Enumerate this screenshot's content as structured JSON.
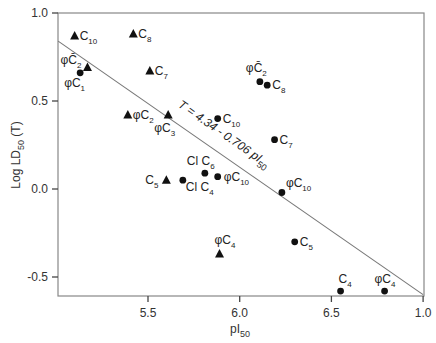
{
  "chart_data": {
    "type": "scatter",
    "title": "",
    "xlabel": "pI50",
    "xlabel_main": "pI",
    "xlabel_sub": "50",
    "ylabel": "Log LD50 (T)",
    "ylabel_main": "Log LD",
    "ylabel_sub": "50",
    "ylabel_suffix": "(T)",
    "xlim": [
      5.01,
      7.0
    ],
    "ylim": [
      -0.6,
      1.0
    ],
    "grid": false,
    "x_ticks": [
      {
        "value": 5.5,
        "label": "5.5"
      },
      {
        "value": 6.0,
        "label": "6.0"
      },
      {
        "value": 6.5,
        "label": "6.5"
      },
      {
        "value": 7.0,
        "label": "1.0"
      }
    ],
    "y_ticks": [
      {
        "value": 1.0,
        "label": "1.0"
      },
      {
        "value": 0.5,
        "label": "0.5"
      },
      {
        "value": 0.0,
        "label": "0.0"
      },
      {
        "value": -0.5,
        "label": "-0.5"
      }
    ],
    "regression": {
      "equation": "T = 4.34 - 0.706 pI50",
      "label_main": "T = 4.34 - 0.706 pI",
      "label_sub": "50",
      "x": [
        5.01,
        7.0
      ],
      "y": [
        0.84,
        -0.6
      ]
    },
    "series": [
      {
        "name": "triangle",
        "marker": "triangle",
        "points": [
          {
            "label": "C",
            "sub": "10",
            "x": 5.1,
            "y": 0.87,
            "lx": 5,
            "ly": 4,
            "anchor": "start"
          },
          {
            "label": "C",
            "sub": "8",
            "x": 5.42,
            "y": 0.88,
            "lx": 5,
            "ly": 4,
            "anchor": "start"
          },
          {
            "label": "φC̄",
            "sub": "2",
            "x": 5.17,
            "y": 0.69,
            "lx": -6,
            "ly": -4,
            "anchor": "end"
          },
          {
            "label": "C",
            "sub": "7",
            "x": 5.51,
            "y": 0.67,
            "lx": 5,
            "ly": 4,
            "anchor": "start"
          },
          {
            "label": "φC",
            "sub": "2",
            "x": 5.39,
            "y": 0.42,
            "lx": 5,
            "ly": 4,
            "anchor": "start"
          },
          {
            "label": "φC",
            "sub": "3",
            "x": 5.61,
            "y": 0.42,
            "lx": -14,
            "ly": 17,
            "anchor": "start"
          },
          {
            "label": "C",
            "sub": "5",
            "x": 5.6,
            "y": 0.05,
            "lx": -8,
            "ly": 4,
            "anchor": "end"
          },
          {
            "label": "φC",
            "sub": "4",
            "x": 5.89,
            "y": -0.37,
            "lx": -5,
            "ly": -10,
            "anchor": "start"
          }
        ]
      },
      {
        "name": "circle",
        "marker": "circle",
        "points": [
          {
            "label": "φC",
            "sub": "1",
            "x": 5.13,
            "y": 0.66,
            "lx": -16,
            "ly": 14,
            "anchor": "start"
          },
          {
            "label": "C",
            "sub": "10",
            "x": 5.88,
            "y": 0.4,
            "lx": 5,
            "ly": 4,
            "anchor": "start"
          },
          {
            "label": "φC̄",
            "sub": "2",
            "x": 6.11,
            "y": 0.61,
            "lx": -14,
            "ly": -10,
            "anchor": "start"
          },
          {
            "label": "C",
            "sub": "8",
            "x": 6.15,
            "y": 0.59,
            "lx": 5,
            "ly": 4,
            "anchor": "start"
          },
          {
            "label": "C",
            "sub": "7",
            "x": 6.19,
            "y": 0.28,
            "lx": 5,
            "ly": 4,
            "anchor": "start"
          },
          {
            "label": "Cl C",
            "sub": "6",
            "x": 5.81,
            "y": 0.09,
            "lx": -18,
            "ly": -8,
            "anchor": "start"
          },
          {
            "label": "Cl C",
            "sub": "4",
            "x": 5.69,
            "y": 0.05,
            "lx": 3,
            "ly": 11,
            "anchor": "start"
          },
          {
            "label": "φC",
            "sub": "10",
            "x": 5.88,
            "y": 0.07,
            "lx": 6,
            "ly": 4,
            "anchor": "start"
          },
          {
            "label": "φC",
            "sub": "10",
            "x": 6.23,
            "y": -0.02,
            "lx": 4,
            "ly": -6,
            "anchor": "start"
          },
          {
            "label": "C",
            "sub": "5",
            "x": 6.3,
            "y": -0.3,
            "lx": 5,
            "ly": 4,
            "anchor": "start"
          },
          {
            "label": "C",
            "sub": "4",
            "x": 6.55,
            "y": -0.58,
            "lx": -2,
            "ly": -8,
            "anchor": "start"
          },
          {
            "label": "φC",
            "sub": "4",
            "x": 6.79,
            "y": -0.58,
            "lx": -10,
            "ly": -8,
            "anchor": "start"
          }
        ]
      }
    ]
  }
}
